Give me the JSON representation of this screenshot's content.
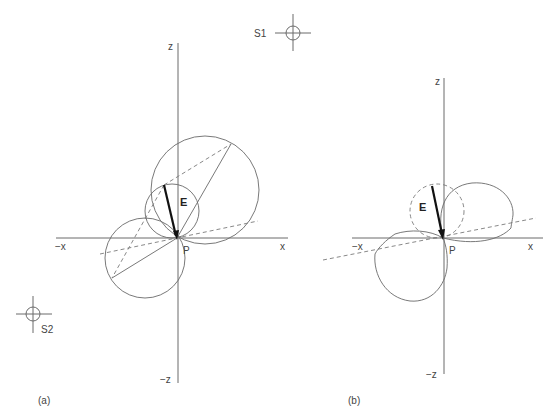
{
  "panels": [
    {
      "id": "a",
      "caption": "(a)",
      "axes": {
        "z_pos": "z",
        "z_neg": "−z",
        "x_pos": "x",
        "x_neg": "−x"
      },
      "point_label": "P",
      "vector_label": "E",
      "sources": [
        {
          "label": "S1",
          "icon": "crosshair-circle"
        },
        {
          "label": "S2",
          "icon": "crosshair-circle"
        }
      ],
      "shapes": [
        "large circle (upper right)",
        "small circle containing E",
        "lower-left circle",
        "solid chords",
        "dashed construction lines"
      ]
    },
    {
      "id": "b",
      "caption": "(b)",
      "axes": {
        "z_pos": "z",
        "z_neg": "−z",
        "x_pos": "x",
        "x_neg": "−x"
      },
      "point_label": "P",
      "vector_label": "E",
      "shapes": [
        "dashed circle containing E",
        "upper-right lobe",
        "lower-left lobe",
        "dashed oblique line"
      ]
    }
  ],
  "colors": {
    "line": "#6a6a6a",
    "vector": "#111111",
    "background": "#ffffff"
  }
}
